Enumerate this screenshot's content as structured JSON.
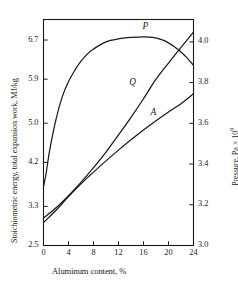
{
  "chart_data": {
    "type": "line",
    "title": "",
    "xlabel": "Aluminum content, %",
    "ylabel": "Stoichiometric energy, total expansion work, MJ/kg",
    "ylabel_right": "Pressure, Pa × 10",
    "ylabel_right_exp": "9",
    "xlim": [
      0,
      24
    ],
    "ylim": [
      2.5,
      7.12
    ],
    "ylim_right": [
      3.0,
      4.11
    ],
    "grid": false,
    "legend": "inline curve labels",
    "xticks": [
      0,
      4,
      8,
      12,
      16,
      20,
      24
    ],
    "xticklabels": [
      "0",
      "4",
      "8",
      "12",
      "16",
      "20",
      "24"
    ],
    "yticks_left": [
      2.5,
      3.3,
      4.2,
      5.0,
      5.9,
      6.7
    ],
    "yticklabels_left": [
      "2.5",
      "3.3",
      "4.2",
      "5.0",
      "5.9",
      "6.7"
    ],
    "yticks_right": [
      3.0,
      3.2,
      3.4,
      3.6,
      3.8,
      4.0
    ],
    "yticklabels_right": [
      "3.0",
      "3.2",
      "3.4",
      "3.6",
      "3.8",
      "4.0"
    ],
    "series": [
      {
        "name": "P",
        "label": "P",
        "axis": "right",
        "x": [
          0,
          0.4,
          1,
          2,
          3,
          4,
          5,
          6,
          7,
          8,
          10,
          12,
          14,
          16,
          17.5,
          19,
          20,
          21,
          22,
          23,
          24
        ],
        "y": [
          3.29,
          3.35,
          3.47,
          3.62,
          3.73,
          3.805,
          3.86,
          3.905,
          3.94,
          3.965,
          4.0,
          4.015,
          4.022,
          4.025,
          4.022,
          4.01,
          3.995,
          3.975,
          3.95,
          3.92,
          3.885
        ]
      },
      {
        "name": "Q",
        "label": "Q",
        "axis": "left",
        "x": [
          0,
          2,
          4,
          6,
          8,
          10,
          12,
          14,
          16,
          18,
          20,
          22,
          24
        ],
        "y": [
          3.06,
          3.27,
          3.52,
          3.79,
          4.09,
          4.41,
          4.76,
          5.12,
          5.5,
          5.9,
          6.23,
          6.55,
          6.86
        ]
      },
      {
        "name": "A",
        "label": "A",
        "axis": "left",
        "x": [
          0,
          2,
          4,
          6,
          8,
          10,
          12,
          14,
          16,
          18,
          20,
          22,
          24
        ],
        "y": [
          2.97,
          3.22,
          3.5,
          3.76,
          4.0,
          4.23,
          4.45,
          4.66,
          4.86,
          5.05,
          5.23,
          5.4,
          5.6
        ]
      }
    ],
    "curve_labels": [
      {
        "text": "P",
        "x": 16.3,
        "y": 6.97
      },
      {
        "text": "Q",
        "x": 14.2,
        "y": 5.82
      },
      {
        "text": "A",
        "x": 17.6,
        "y": 5.2
      }
    ],
    "colors": {
      "line": "#1a1a1a",
      "axis": "#1a1a1a",
      "background": "#ffffff"
    }
  }
}
